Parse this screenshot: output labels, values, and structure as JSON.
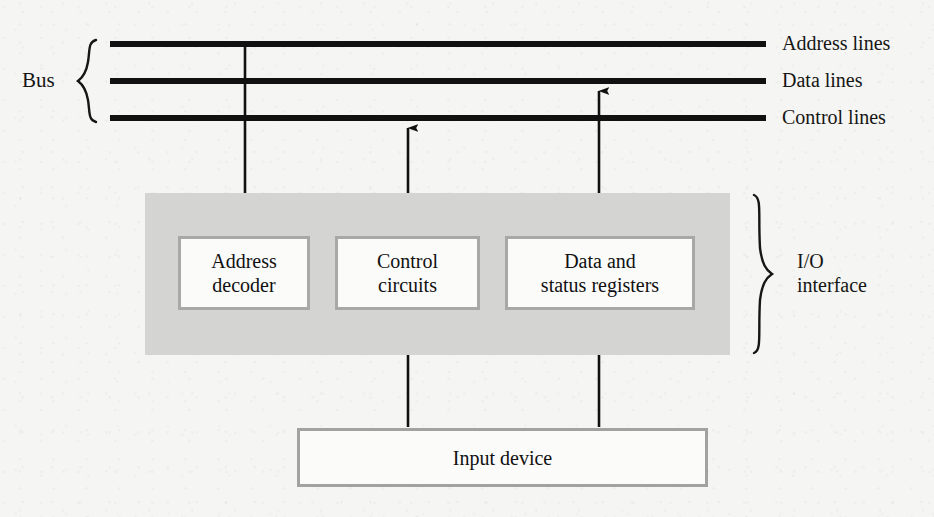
{
  "figure": {
    "background_color": "#f5f5f3",
    "panel_color": "#d4d4d2",
    "box_fill_color": "#fbfbfa",
    "box_border_color": "#a8a8a8",
    "line_color": "#111111"
  },
  "bus": {
    "label": "Bus",
    "lines": [
      {
        "name": "address",
        "label": "Address lines",
        "y": 44
      },
      {
        "name": "data",
        "label": "Data lines",
        "y": 81
      },
      {
        "name": "control",
        "label": "Control lines",
        "y": 118
      }
    ],
    "x_start": 110,
    "x_end": 766
  },
  "io_interface": {
    "label_line1": "I/O",
    "label_line2": "interface",
    "panel": {
      "x": 145,
      "y": 193,
      "width": 585,
      "height": 162
    },
    "blocks": [
      {
        "name": "address-decoder",
        "label_line1": "Address",
        "label_line2": "decoder",
        "x": 178,
        "y": 236,
        "width": 132,
        "height": 74
      },
      {
        "name": "control-circuits",
        "label_line1": "Control",
        "label_line2": "circuits",
        "x": 335,
        "y": 236,
        "width": 145,
        "height": 74
      },
      {
        "name": "data-status-registers",
        "label_line1": "Data and",
        "label_line2": "status registers",
        "x": 505,
        "y": 236,
        "width": 190,
        "height": 74
      }
    ]
  },
  "input_device": {
    "label": "Input device",
    "x": 297,
    "y": 428,
    "width": 411,
    "height": 59
  },
  "connections": [
    {
      "name": "address-lines-to-decoder",
      "x": 245,
      "from_y": 44,
      "to_y": 234,
      "arrows": "down"
    },
    {
      "name": "control-lines-to-control-circuits",
      "x": 408,
      "from_y": 118,
      "to_y": 234,
      "arrows": "both"
    },
    {
      "name": "data-lines-to-registers",
      "x": 599,
      "from_y": 81,
      "to_y": 234,
      "arrows": "both"
    },
    {
      "name": "input-device-to-control-circuits",
      "x": 408,
      "from_y": 427,
      "to_y": 312,
      "arrows": "up"
    },
    {
      "name": "input-device-to-registers",
      "x": 599,
      "from_y": 427,
      "to_y": 312,
      "arrows": "up"
    }
  ]
}
